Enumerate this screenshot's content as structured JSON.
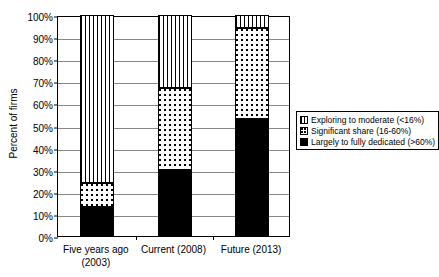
{
  "chart_data": {
    "type": "bar",
    "subtype": "stacked-100-percent",
    "title": "",
    "xlabel": "",
    "ylabel": "Percent of firms",
    "ylim": [
      0,
      100
    ],
    "ytick_labels": [
      "0%",
      "10%",
      "20%",
      "30%",
      "40%",
      "50%",
      "60%",
      "70%",
      "80%",
      "90%",
      "100%"
    ],
    "ytick_values": [
      0,
      10,
      20,
      30,
      40,
      50,
      60,
      70,
      80,
      90,
      100
    ],
    "grid": true,
    "legend_position": "right",
    "categories": [
      "Five years ago (2003)",
      "Current (2008)",
      "Future (2013)"
    ],
    "category_lines": [
      [
        "Five years ago",
        "(2003)"
      ],
      [
        "Current (2008)"
      ],
      [
        "Future (2013)"
      ]
    ],
    "series": [
      {
        "name": "Largely to fully dedicated (>60%)",
        "pattern": "solid-black",
        "values": [
          13,
          30,
          53
        ]
      },
      {
        "name": "Significant share (16-60%)",
        "pattern": "dotted",
        "values": [
          11,
          37,
          41
        ]
      },
      {
        "name": "Exploring to moderate (<16%)",
        "pattern": "vstripes",
        "values": [
          76,
          33,
          6
        ]
      }
    ],
    "legend_entries": [
      {
        "label": "Exploring to moderate (<16%)",
        "pattern": "vstripes"
      },
      {
        "label": "Significant share (16-60%)",
        "pattern": "dotted"
      },
      {
        "label": "Largely to fully dedicated (>60%)",
        "pattern": "solid-black"
      }
    ],
    "colors": {
      "axis": "#000000",
      "gridline": "#888888",
      "background": "#ffffff",
      "fill_dedicated": "#000000",
      "fill_significant": "#ffffff",
      "fill_exploring": "#ffffff"
    }
  }
}
